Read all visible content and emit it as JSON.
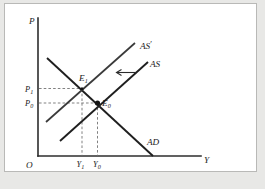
{
  "figure": {
    "type": "economics-ad-as-diagram",
    "axes": {
      "origin_label": "O",
      "y_axis_label": "P",
      "x_axis_label": "Y"
    },
    "curves": [
      {
        "id": "ad",
        "label": "AD",
        "description": "aggregate demand, downward sloping"
      },
      {
        "id": "as",
        "label": "AS",
        "description": "aggregate supply, upward sloping"
      },
      {
        "id": "as1",
        "label": "AS",
        "prime": "′",
        "description": "shifted aggregate supply, upward sloping, shifted left"
      }
    ],
    "points": [
      {
        "id": "e0",
        "base": "E",
        "sub": "0",
        "description": "initial equilibrium AD x AS"
      },
      {
        "id": "e1",
        "base": "E",
        "sub": "1",
        "description": "new equilibrium AD x AS-prime"
      }
    ],
    "price_ticks": [
      {
        "id": "p1",
        "base": "P",
        "sub": "1"
      },
      {
        "id": "p0",
        "base": "P",
        "sub": "0"
      }
    ],
    "output_ticks": [
      {
        "id": "y1",
        "base": "Y",
        "sub": "1"
      },
      {
        "id": "y0",
        "base": "Y",
        "sub": "0"
      }
    ],
    "annotations": [
      {
        "id": "shift-arrow",
        "glyph": "←",
        "description": "leftward shift of AS to AS-prime"
      }
    ],
    "colors": {
      "curve": "#1f1f1f",
      "axis": "#2c2c2c",
      "guide": "#6a6a6a",
      "page_background": "#e8e8e6",
      "sheet_background": "#ffffff",
      "sheet_border": "#b9b9b7"
    }
  }
}
